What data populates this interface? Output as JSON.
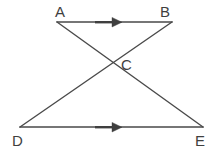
{
  "figure": {
    "background_color": "#ffffff",
    "stroke_color": "#4a4a4a",
    "label_color": "#3f3f3f",
    "stroke_width": 1.4,
    "width": 220,
    "height": 159
  },
  "labels": {
    "a": "A",
    "b": "B",
    "c": "C",
    "d": "D",
    "e": "E"
  },
  "points": [
    {
      "name": "A",
      "x": 57,
      "y": 22,
      "label": "A",
      "label_x": 55,
      "label_y": 4
    },
    {
      "name": "B",
      "x": 172,
      "y": 22,
      "label": "B",
      "label_x": 160,
      "label_y": 4
    },
    {
      "name": "C",
      "x": 115,
      "y": 63,
      "label": "C",
      "label_x": 121,
      "label_y": 57
    },
    {
      "name": "D",
      "x": 20,
      "y": 127,
      "label": "D",
      "label_x": 12,
      "label_y": 133
    },
    {
      "name": "E",
      "x": 203,
      "y": 127,
      "label": "E",
      "label_x": 195,
      "label_y": 133
    }
  ],
  "segments": [
    {
      "name": "segment-AB",
      "from": "A",
      "to": "B",
      "x1": 57,
      "y1": 22,
      "x2": 172,
      "y2": 22,
      "arrow_mark": true
    },
    {
      "name": "segment-DE",
      "from": "D",
      "to": "E",
      "x1": 20,
      "y1": 127,
      "x2": 203,
      "y2": 127,
      "arrow_mark": true
    },
    {
      "name": "segment-AE",
      "from": "A",
      "to": "E",
      "x1": 57,
      "y1": 22,
      "x2": 203,
      "y2": 127,
      "arrow_mark": false
    },
    {
      "name": "segment-DB",
      "from": "D",
      "to": "B",
      "x1": 20,
      "y1": 127,
      "x2": 172,
      "y2": 22,
      "arrow_mark": false
    }
  ],
  "arrow_marks": [
    {
      "name": "parallel-arrow-AB",
      "on": "segment-AB",
      "tail_x": 95,
      "tail_y": 22,
      "tip_x": 122,
      "tip_y": 22,
      "direction": "right"
    },
    {
      "name": "parallel-arrow-DE",
      "on": "segment-DE",
      "tail_x": 95,
      "tail_y": 127,
      "tip_x": 122,
      "tip_y": 127,
      "direction": "right"
    }
  ]
}
